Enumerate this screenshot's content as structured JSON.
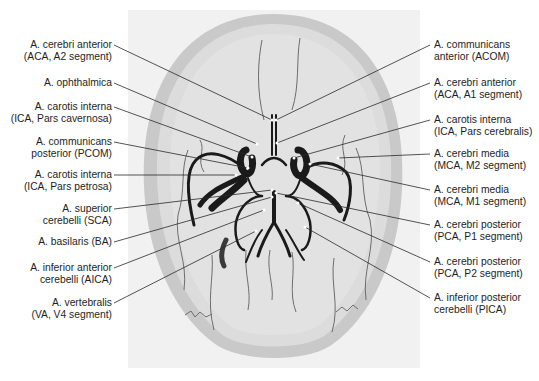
{
  "figure": {
    "colors": {
      "background": "#ffffff",
      "panel": "#f1f1f1",
      "skull": "#c9c9c9",
      "skull_inner": "#dcdcdc",
      "vessel": "#1a1a1a",
      "leader_line": "#2a2a2a",
      "text": "#1e1e1e"
    }
  },
  "labels_left": [
    {
      "id": "aca-a2",
      "line1": "A. cerebri anterior",
      "line2": "(ACA, A2 segment)"
    },
    {
      "id": "ophthalmica",
      "line1": "A. ophthalmica",
      "line2": ""
    },
    {
      "id": "ica-cavernosa",
      "line1": "A. carotis interna",
      "line2": "(ICA, Pars cavernosa)"
    },
    {
      "id": "pcom",
      "line1": "A. communicans",
      "line2": "posterior (PCOM)"
    },
    {
      "id": "ica-petrosa",
      "line1": "A. carotis interna",
      "line2": "(ICA, Pars petrosa)"
    },
    {
      "id": "sca",
      "line1": "A. superior",
      "line2": "cerebelli (SCA)"
    },
    {
      "id": "ba",
      "line1": "A. basilaris (BA)",
      "line2": ""
    },
    {
      "id": "aica",
      "line1": "A. inferior anterior",
      "line2": "cerebelli (AICA)"
    },
    {
      "id": "va-v4",
      "line1": "A. vertebralis",
      "line2": "(VA, V4 segment)"
    }
  ],
  "labels_right": [
    {
      "id": "acom",
      "line1": "A. communicans",
      "line2": "anterior (ACOM)"
    },
    {
      "id": "aca-a1",
      "line1": "A. cerebri anterior",
      "line2": "(ACA, A1 segment)"
    },
    {
      "id": "ica-cerebralis",
      "line1": "A. carotis interna",
      "line2": "(ICA, Pars cerebralis)"
    },
    {
      "id": "mca-m2",
      "line1": "A. cerebri media",
      "line2": "(MCA, M2 segment)"
    },
    {
      "id": "mca-m1",
      "line1": "A. cerebri media",
      "line2": "(MCA, M1 segment)"
    },
    {
      "id": "pca-p1",
      "line1": "A. cerebri posterior",
      "line2": "(PCA, P1 segment)"
    },
    {
      "id": "pca-p2",
      "line1": "A. cerebri posterior",
      "line2": "(PCA, P2 segment)"
    },
    {
      "id": "pica",
      "line1": "A. inferior posterior",
      "line2": "cerebelli (PICA)"
    }
  ]
}
